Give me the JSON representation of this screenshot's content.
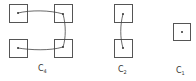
{
  "diagram": {
    "stroke_color": "#555555",
    "groups": [
      {
        "id": "c4",
        "label": "C",
        "subscript": "4",
        "boxes": 4,
        "connection": "open loop through all four cells"
      },
      {
        "id": "c2",
        "label": "C",
        "subscript": "2",
        "boxes": 2,
        "connection": "single link between two cells"
      },
      {
        "id": "c1",
        "label": "C",
        "subscript": "1",
        "boxes": 1,
        "connection": "none"
      }
    ]
  }
}
